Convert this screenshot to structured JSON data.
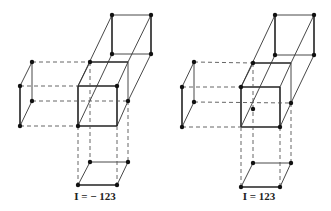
{
  "figures": [
    {
      "id": "left",
      "label": "I = − 123",
      "main_cube": {
        "front": [
          [
            78,
            86
          ],
          [
            117,
            86
          ],
          [
            117,
            126
          ],
          [
            78,
            126
          ]
        ],
        "back": [
          [
            90,
            62
          ],
          [
            128,
            62
          ],
          [
            128,
            101
          ],
          [
            90,
            101
          ]
        ]
      },
      "top_square": [
        [
          112,
          15
        ],
        [
          151,
          15
        ],
        [
          151,
          54
        ],
        [
          112,
          54
        ]
      ],
      "left_square": {
        "front": [
          [
            20,
            86
          ],
          [
            20,
            126
          ]
        ],
        "back": [
          [
            32,
            62
          ],
          [
            32,
            101
          ]
        ]
      },
      "bottom_square": {
        "front": [
          [
            78,
            185
          ],
          [
            117,
            185
          ]
        ],
        "back": [
          [
            90,
            162
          ],
          [
            128,
            162
          ]
        ]
      },
      "label_pos": [
        95,
        200
      ]
    },
    {
      "id": "right",
      "label": "I = 123",
      "main_cube": {
        "front": [
          [
            241,
            87
          ],
          [
            280,
            87
          ],
          [
            280,
            127
          ],
          [
            241,
            127
          ]
        ],
        "back": [
          [
            253,
            63
          ],
          [
            291,
            63
          ],
          [
            291,
            103
          ],
          [
            253,
            103
          ]
        ]
      },
      "top_square": [
        [
          275,
          15
        ],
        [
          314,
          15
        ],
        [
          314,
          55
        ],
        [
          275,
          55
        ]
      ],
      "left_square": {
        "front": [
          [
            182,
            87
          ],
          [
            182,
            127
          ]
        ],
        "back": [
          [
            194,
            62
          ],
          [
            194,
            102
          ]
        ]
      },
      "bottom_square": {
        "front": [
          [
            241,
            187
          ],
          [
            280,
            187
          ]
        ],
        "back": [
          [
            253,
            163
          ],
          [
            291,
            163
          ]
        ]
      },
      "label_pos": [
        259,
        200
      ]
    }
  ]
}
